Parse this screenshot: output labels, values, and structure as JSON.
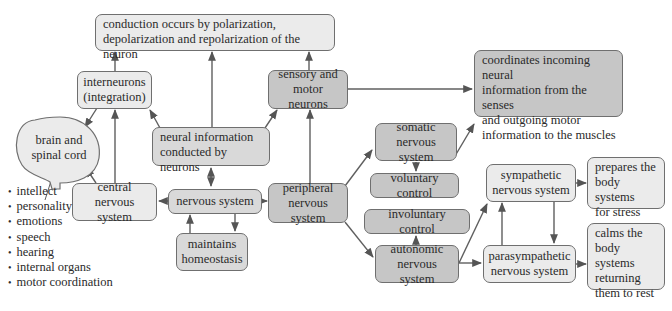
{
  "diagram": {
    "colors": {
      "light_fill": "#ebebeb",
      "mid_fill": "#d9d9d9",
      "dark_fill": "#c6c6c6",
      "stroke": "#6f6f6f",
      "arrow": "#5a5a5a"
    },
    "nodes": {
      "conduction": {
        "line1": "conduction occurs by polarization,",
        "line2": "depolarization and repolarization of the neuron"
      },
      "interneurons": {
        "line1": "interneurons",
        "line2": "(integration)"
      },
      "brain": {
        "line1": "brain and",
        "line2": "spinal cord"
      },
      "sensory_motor": {
        "line1": "sensory and",
        "line2": "motor neurons"
      },
      "neural_info": {
        "line1": "neural information",
        "line2": "conducted by neurons"
      },
      "central": {
        "line1": "central",
        "line2": "nervous system"
      },
      "nervous": {
        "line1": "nervous system"
      },
      "homeostasis": {
        "line1": "maintains",
        "line2": "homeostasis"
      },
      "peripheral": {
        "line1": "peripheral",
        "line2": "nervous system"
      },
      "coordinates": {
        "line1": "coordinates incoming neural",
        "line2": "information from the senses",
        "line3": "and outgoing motor",
        "line4": "information to the muscles"
      },
      "somatic": {
        "line1": "somatic",
        "line2": "nervous system"
      },
      "voluntary": {
        "line1": "voluntary control"
      },
      "involuntary": {
        "line1": "involuntary control"
      },
      "autonomic": {
        "line1": "autonomic",
        "line2": "nervous system"
      },
      "sympathetic": {
        "line1": "sympathetic",
        "line2": "nervous system"
      },
      "parasympathetic": {
        "line1": "parasympathetic",
        "line2": "nervous system"
      },
      "prepares": {
        "line1": "prepares the",
        "line2": "body systems",
        "line3": "for stress"
      },
      "calms": {
        "line1": "calms the",
        "line2": "body systems",
        "line3": "returning",
        "line4": "them to rest"
      }
    },
    "brain_functions": [
      "intellect",
      "personality",
      "emotions",
      "speech",
      "hearing",
      "internal organs",
      "motor coordination"
    ]
  }
}
